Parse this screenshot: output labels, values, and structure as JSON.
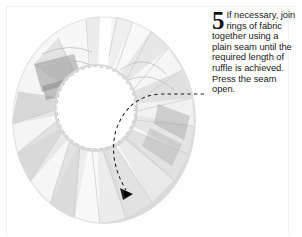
{
  "page": {
    "width": 302,
    "height": 237,
    "background_color": "#ffffff",
    "frame_color": "#f0f0f0"
  },
  "instruction": {
    "step_number": "5",
    "text": "If necessary, join rings of fabric together using a plain seam until the required length of ruffle is achieved. Press the seam open.",
    "text_color": "#1a1a1a"
  },
  "photo": {
    "subject": "white ruffled fabric ring with radial pleats",
    "background_color": "#ffffff",
    "fabric_light": "#fbfbfb",
    "fabric_mid": "#ececec",
    "fabric_shadow": "#cfcfcf",
    "fabric_dark": "#9a9a9a",
    "annotation": {
      "type": "dashed-curved-arrow",
      "color": "#1c1c1c",
      "points_from": "caption",
      "points_to": "seam at lower edge of ruffle",
      "arrowhead_label": "seam-arrowhead"
    },
    "gap_label": "ring opening at top where rings are joined"
  }
}
